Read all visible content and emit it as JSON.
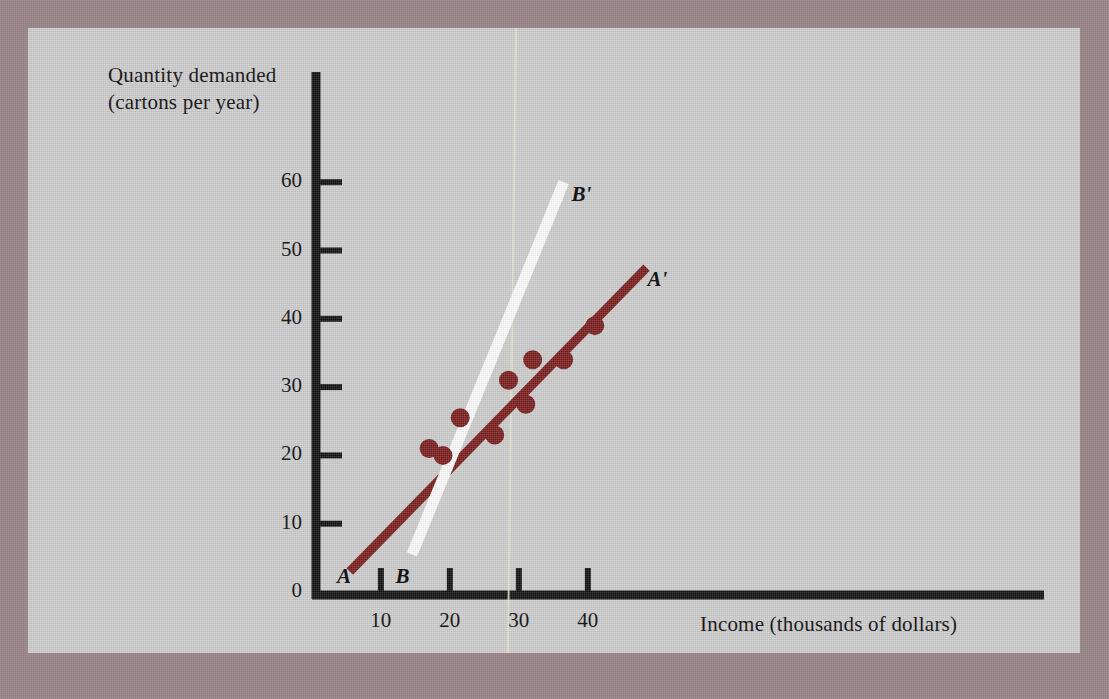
{
  "figure": {
    "mount_color": "#9b878a",
    "panel_color": "#cfcfd0"
  },
  "chart_data": {
    "type": "scatter",
    "title": "",
    "xlabel": "Income (thousands of dollars)",
    "ylabel": "Quantity demanded\n(cartons per year)",
    "xlim": [
      0,
      47
    ],
    "ylim": [
      0,
      66
    ],
    "xticks": [
      10,
      20,
      30,
      40
    ],
    "yticks": [
      0,
      10,
      20,
      30,
      40,
      50,
      60
    ],
    "xtick_labels": [
      "10",
      "20",
      "30",
      "40"
    ],
    "ytick_labels": [
      "0",
      "10",
      "20",
      "30",
      "40",
      "50",
      "60"
    ],
    "grid": false,
    "legend": "none",
    "point_color": "#7b1d1d",
    "points": [
      {
        "x": 17.0,
        "y": 21.0
      },
      {
        "x": 19.0,
        "y": 20.0
      },
      {
        "x": 21.5,
        "y": 25.5
      },
      {
        "x": 26.5,
        "y": 23.0
      },
      {
        "x": 28.5,
        "y": 31.0
      },
      {
        "x": 31.0,
        "y": 27.5
      },
      {
        "x": 32.0,
        "y": 34.0
      },
      {
        "x": 36.5,
        "y": 34.0
      },
      {
        "x": 41.0,
        "y": 39.0
      }
    ],
    "series": [
      {
        "name": "AA'",
        "type": "line",
        "color": "#7b1d1d",
        "start_label": "A",
        "end_label": "A'",
        "x": [
          5.5,
          48.5
        ],
        "y": [
          3.0,
          47.5
        ]
      },
      {
        "name": "BB'",
        "type": "line",
        "color": "#ffffff",
        "start_label": "B",
        "end_label": "B'",
        "x": [
          14.5,
          36.5
        ],
        "y": [
          5.5,
          60.0
        ]
      }
    ],
    "annotations": [
      {
        "text": "A",
        "x": 4.5,
        "y": 2.0,
        "style": "italic"
      },
      {
        "text": "A'",
        "x": 49.5,
        "y": 45.5,
        "style": "italic"
      },
      {
        "text": "B",
        "x": 13.0,
        "y": 2.0,
        "style": "italic"
      },
      {
        "text": "B'",
        "x": 38.5,
        "y": 58.0,
        "style": "italic"
      }
    ]
  }
}
